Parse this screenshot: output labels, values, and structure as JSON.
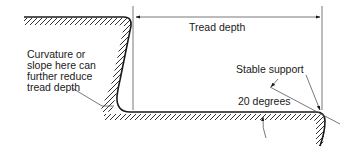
{
  "diagram": {
    "type": "stair tread cross-section",
    "colors": {
      "line": "#1a1a1a",
      "dimension_line": "#555555",
      "background": "#ffffff"
    },
    "labels": {
      "tread_depth": "Tread depth",
      "curvature_note_line1": "Curvature or",
      "curvature_note_line2": "slope here can",
      "curvature_note_line3": "further reduce",
      "curvature_note_line4": "tread depth",
      "stable_support": "Stable support",
      "angle": "20 degrees"
    }
  }
}
